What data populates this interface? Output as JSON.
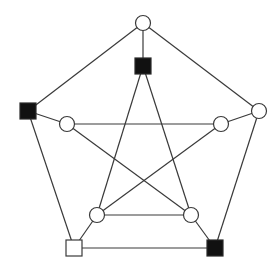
{
  "diagram": {
    "type": "graph",
    "nodes": [
      {
        "id": "outer-top",
        "shape": "circle",
        "fill": "white",
        "x": 143,
        "y": 23
      },
      {
        "id": "outer-right",
        "shape": "circle",
        "fill": "white",
        "x": 259,
        "y": 111
      },
      {
        "id": "outer-bottom-right",
        "shape": "square",
        "fill": "black",
        "x": 215,
        "y": 248
      },
      {
        "id": "outer-bottom-left",
        "shape": "square",
        "fill": "white",
        "x": 74,
        "y": 248
      },
      {
        "id": "outer-left",
        "shape": "square",
        "fill": "black",
        "x": 28,
        "y": 111
      },
      {
        "id": "inner-top",
        "shape": "square",
        "fill": "black",
        "x": 143,
        "y": 66
      },
      {
        "id": "inner-right",
        "shape": "circle",
        "fill": "white",
        "x": 221,
        "y": 124
      },
      {
        "id": "inner-bottom-right",
        "shape": "circle",
        "fill": "white",
        "x": 191,
        "y": 215
      },
      {
        "id": "inner-bottom-left",
        "shape": "circle",
        "fill": "white",
        "x": 97,
        "y": 215
      },
      {
        "id": "inner-left",
        "shape": "circle",
        "fill": "white",
        "x": 67,
        "y": 124
      }
    ],
    "edges": [
      [
        "outer-top",
        "outer-right"
      ],
      [
        "outer-right",
        "outer-bottom-right"
      ],
      [
        "outer-bottom-right",
        "outer-bottom-left"
      ],
      [
        "outer-bottom-left",
        "outer-left"
      ],
      [
        "outer-left",
        "outer-top"
      ],
      [
        "outer-top",
        "inner-top"
      ],
      [
        "outer-right",
        "inner-right"
      ],
      [
        "outer-bottom-right",
        "inner-bottom-right"
      ],
      [
        "outer-bottom-left",
        "inner-bottom-left"
      ],
      [
        "outer-left",
        "inner-left"
      ],
      [
        "inner-top",
        "inner-bottom-left"
      ],
      [
        "inner-top",
        "inner-bottom-right"
      ],
      [
        "inner-left",
        "inner-right"
      ],
      [
        "inner-left",
        "inner-bottom-right"
      ],
      [
        "inner-right",
        "inner-bottom-left"
      ],
      [
        "inner-bottom-left",
        "inner-bottom-right"
      ]
    ],
    "colors": {
      "edge": "#3a3a3a",
      "black_node": "#111111",
      "white_node": "#ffffff",
      "background": "#ffffff"
    }
  }
}
